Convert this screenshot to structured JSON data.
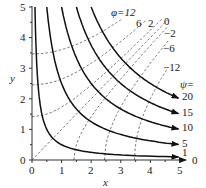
{
  "chart_data": {
    "type": "line",
    "title": "",
    "xlabel": "x",
    "ylabel": "y",
    "xlim": [
      0,
      5
    ],
    "ylim": [
      0,
      5
    ],
    "x_ticks": [
      "0",
      "1",
      "2",
      "3",
      "4",
      "5"
    ],
    "y_ticks": [
      "0",
      "1",
      "2",
      "3",
      "4",
      "5"
    ],
    "grid": false,
    "streamlines": {
      "label_prefix": "ψ=",
      "style": "solid with arrow",
      "relation": "psi = 2xy",
      "series": [
        {
          "name": "0",
          "value": 0
        },
        {
          "name": "1",
          "value": 1
        },
        {
          "name": "5",
          "value": 5
        },
        {
          "name": "10",
          "value": 10
        },
        {
          "name": "15",
          "value": 15
        },
        {
          "name": "20",
          "value": 20
        }
      ]
    },
    "potential_lines": {
      "label_prefix": "φ=",
      "style": "dashed",
      "relation": "phi = x^2 - y^2",
      "series": [
        {
          "name": "12",
          "value": 12
        },
        {
          "name": "6",
          "value": 6
        },
        {
          "name": "2",
          "value": 2
        },
        {
          "name": "0",
          "value": 0
        },
        {
          "name": "-2",
          "value": -2
        },
        {
          "name": "-6",
          "value": -6
        },
        {
          "name": "-12",
          "value": -12
        }
      ]
    }
  },
  "labels": {
    "phi_first": "φ=12",
    "phi_6": "6",
    "phi_2": "2",
    "phi_0": "0",
    "phi_m2": "−2",
    "phi_m6": "−6",
    "phi_m12": "−12",
    "psi_prefix": "ψ=",
    "psi_20": "20",
    "psi_15": "15",
    "psi_10": "10",
    "psi_5": "5",
    "psi_1": "1",
    "psi_0": "0",
    "x_axis": "x",
    "y_axis": "y",
    "xt0": "0",
    "xt1": "1",
    "xt2": "2",
    "xt3": "3",
    "xt4": "4",
    "xt5": "5",
    "yt0": "0",
    "yt1": "1",
    "yt2": "2",
    "yt3": "3",
    "yt4": "4",
    "yt5": "5"
  },
  "colors": {
    "line": "#111111",
    "dash": "#666666",
    "axis": "#333333"
  }
}
